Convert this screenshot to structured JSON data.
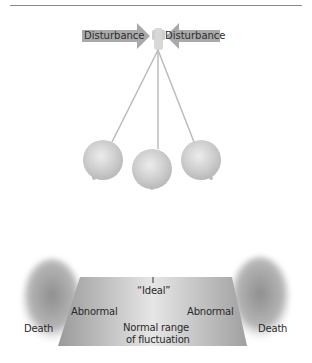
{
  "figure": {
    "type": "homeostasis-pendulum-diagram",
    "top_panel": {
      "arrows": [
        {
          "label": "Disturbance",
          "direction": "right"
        },
        {
          "label": "Disturbance",
          "direction": "left"
        }
      ],
      "pendulum": {
        "bob_count": 3,
        "positions": [
          "left-swing",
          "rest",
          "right-swing"
        ]
      }
    },
    "bottom_panel": {
      "ideal_label": "“Ideal”",
      "abnormal_left": "Abnormal",
      "abnormal_right": "Abnormal",
      "death_left": "Death",
      "death_right": "Death",
      "normal_range_line1": "Normal range",
      "normal_range_line2": "of fluctuation"
    }
  },
  "colors": {
    "arrow_fill": "#a9a9a9",
    "bob_fill": "#cfcfcf",
    "trapezoid_fill": "#bdbdbd",
    "cloud_fill": "#9c9c9c",
    "text": "#2a2a2a"
  }
}
